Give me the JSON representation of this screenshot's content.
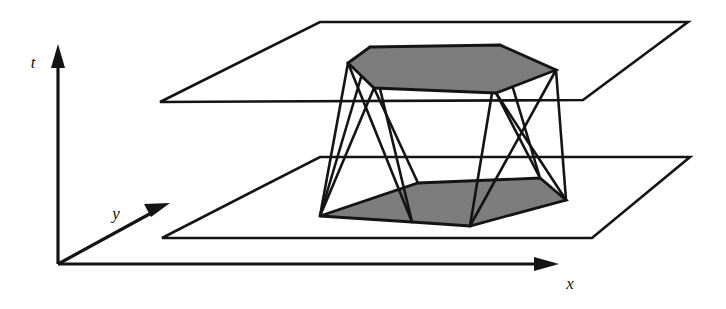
{
  "figure": {
    "background_color": "#ffffff",
    "line_color": "#141414",
    "shade_color": "#7d7d7d",
    "axes": {
      "t_label": "t",
      "y_label": "y",
      "x_label": "x",
      "origin": [
        58,
        264
      ],
      "t_tip": [
        58,
        48
      ],
      "x_tip": [
        558,
        264
      ],
      "y_tip": [
        168,
        204
      ]
    },
    "planes": [
      {
        "name": "upper-plane",
        "points": "160,102 320,22 688,22 583,100"
      },
      {
        "name": "lower-plane",
        "points": "162,238 320,157 690,157 592,238"
      }
    ],
    "solid": {
      "top_face": "348,63 370,47 500,45 556,70 496,93 374,88",
      "bottom_face": "320,216 418,183 540,178 566,200 470,226 412,222",
      "edges": [
        "348,63 320,216",
        "370,47 412,222",
        "500,45 470,226",
        "556,70 566,200",
        "496,93 540,178",
        "374,88 418,183",
        "348,63 412,222",
        "370,47 320,216",
        "500,45 540,178",
        "556,70 470,226",
        "374,88 320,216",
        "496,93 566,200"
      ]
    }
  }
}
